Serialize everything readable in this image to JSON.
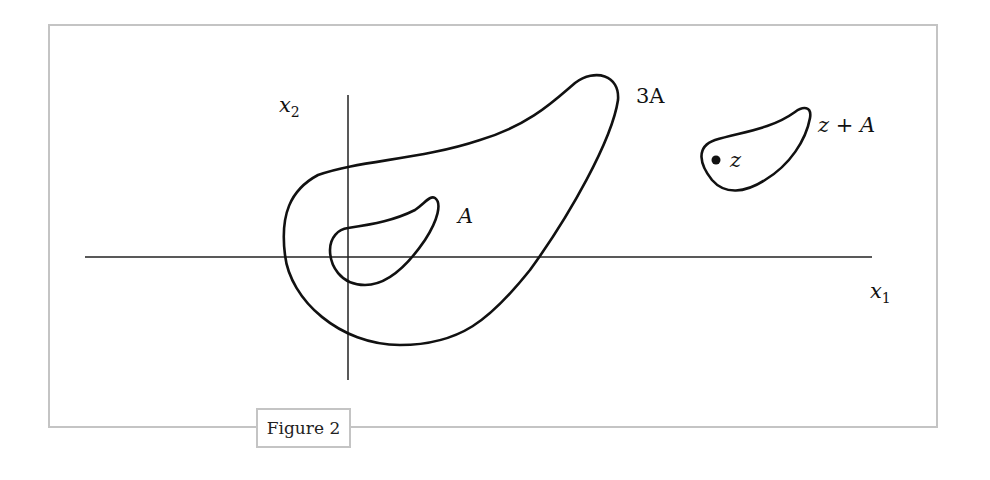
{
  "figure": {
    "caption": "Figure 2",
    "frame_color": "#c4c4c4",
    "stroke_color": "#111111"
  },
  "axes": {
    "x_label": "x",
    "x_label_sub": "1",
    "y_label": "x",
    "y_label_sub": "2"
  },
  "shapes": {
    "small": {
      "label": "A"
    },
    "large": {
      "label": "3A"
    },
    "translate": {
      "label": "z + A",
      "point_label": "z"
    }
  }
}
